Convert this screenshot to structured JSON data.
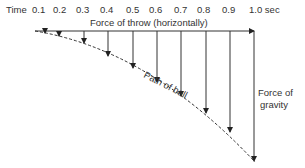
{
  "diagram": {
    "time_label": "Time",
    "time_ticks": [
      "0.1",
      "0.2",
      "0.3",
      "0.4",
      "0.5",
      "0.6",
      "0.7",
      "0.8",
      "0.9",
      "1.0 sec"
    ],
    "horizontal_force_label": "Force of throw (horizontally)",
    "path_label": "Path of ball",
    "gravity_label_line1": "Force of",
    "gravity_label_line2": "gravity"
  }
}
